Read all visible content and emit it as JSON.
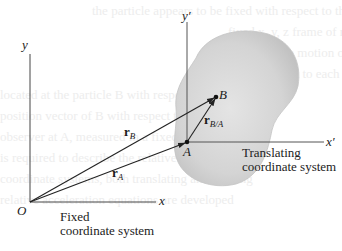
{
  "figure": {
    "background_lines": [
      "the particle appears to be fixed with respect to the translating",
      "fixed x, y, z frame of reference",
      "the relative motion of particle B with respect to the",
      "with respect to each other and to the body",
      "located at the particle B with respect to the body",
      "position vector of B with respect to the translating",
      "observer at A, measured in a fixed frame",
      "is required to describe the relative position",
      "coordinate systems, both translating and rotating",
      "relative acceleration equations are developed"
    ],
    "fixed_frame": {
      "origin_label": "O",
      "x_axis_label": "x",
      "y_axis_label": "y",
      "caption_line1": "Fixed",
      "caption_line2": "coordinate system"
    },
    "translating_frame": {
      "origin_label": "A",
      "x_axis_label": "x′",
      "y_axis_label": "y′",
      "caption_line1": "Translating",
      "caption_line2": "coordinate system"
    },
    "points": {
      "A": "A",
      "B": "B"
    },
    "vectors": {
      "rA": {
        "main": "r",
        "sub": "A"
      },
      "rB": {
        "main": "r",
        "sub": "B"
      },
      "rBA": {
        "main": "r",
        "sub": "B/A"
      }
    },
    "colors": {
      "line": "#333333",
      "body_fill": "#d2d2d2",
      "body_edge": "#bdbdbd",
      "text": "#1a1a1a"
    }
  }
}
